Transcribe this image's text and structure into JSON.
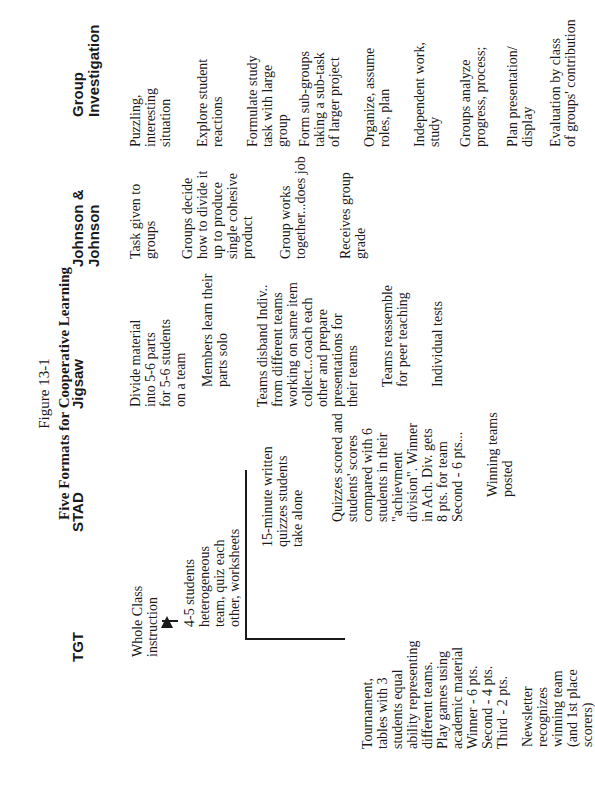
{
  "figure": {
    "number": "Figure 13-1",
    "title": "Five Formats for Cooperative Learning"
  },
  "columns": [
    {
      "heading": "TGT",
      "steps": [
        "Whole Class\ninstruction",
        "4-5 students\nheterogeneous\nteam, quiz each\nother, worksheets",
        "Tournament,\ntables with 3\nstudents equal\nability representing\ndifferent teams.\nPlay games using\nacademic material\nWinner - 6 pts.\nSecond - 4 pts.\nThird - 2 pts.",
        "Newsletter\nrecognizes\nwinning team\n(and 1st place\nscorers)"
      ]
    },
    {
      "heading": "STAD",
      "steps": [
        "15-minute written\nquizzes students\ntake alone",
        "Quizzes scored and\nstudents' scores\ncompared with 6\nstudents in their\n\"achievment\ndivision\". Winner\nin Ach. Div. gets\n8 pts. for team\nSecond - 6 pts...",
        "Winning teams\nposted"
      ]
    },
    {
      "heading": "Jigsaw",
      "steps": [
        "Divide material\ninto 5-6 parts\nfor 5-6 students\non a team",
        "Members learn their\nparts solo",
        "Teams disband Indiv..\nfrom different teams\nworking on same item\ncollect...coach each\nother and prepare\npresentations for\ntheir teams",
        "Teams reassemble\nfor peer teaching",
        "Individual tests"
      ]
    },
    {
      "heading": "Johnson &\nJohnson",
      "steps": [
        "Task given to\ngroups",
        "Groups decide\nhow to divide it\nup to produce\nsingle cohesive\nproduct",
        "Group works\ntogether...does job",
        "Receives group\ngrade"
      ]
    },
    {
      "heading": "Group\nInvestigation",
      "steps": [
        "Puzzling,\ninteresting\nsituation",
        "Explore student\nreactions",
        "Formulate study\ntask with large\ngroup",
        "Form sub-groups\ntaking a sub-task\nof larger project",
        "Organize, assume\nroles, plan",
        "Independent work,\nstudy",
        "Groups analyze\nprogress, process;",
        "Plan presentation/\ndisplay",
        "Evaluation by class\nof groups' contribution"
      ]
    }
  ]
}
